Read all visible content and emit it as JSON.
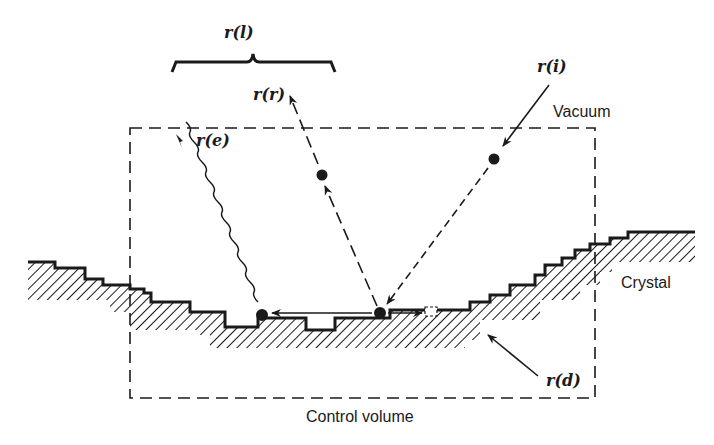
{
  "diagram": {
    "labels": {
      "r_l": "r(l)",
      "r_r": "r(r)",
      "r_i": "r(i)",
      "r_e": "r(e)",
      "r_d": "r(d)",
      "vacuum": "Vacuum",
      "crystal": "Crystal",
      "control_volume": "Control volume"
    },
    "colors": {
      "ink": "#1a1a1a",
      "background": "#ffffff"
    }
  }
}
